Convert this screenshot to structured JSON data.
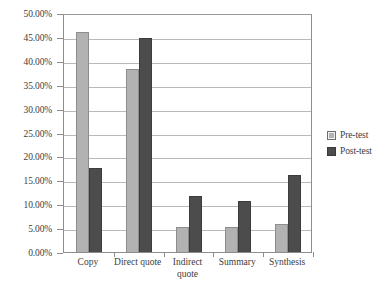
{
  "chart_data": {
    "type": "bar",
    "title": "",
    "xlabel": "",
    "ylabel": "",
    "ylim": [
      0,
      50
    ],
    "ytick_step": 5,
    "grid": true,
    "legend_position": "right",
    "categories": [
      "Copy",
      "Direct quote",
      "Indirect quote",
      "Summary",
      "Synthesis"
    ],
    "ytick_labels": [
      "0.00%",
      "5.00%",
      "10.00%",
      "15.00%",
      "20.00%",
      "25.00%",
      "30.00%",
      "35.00%",
      "40.00%",
      "45.00%",
      "50.00%"
    ],
    "series": [
      {
        "name": "Pre-test",
        "color": "#b2b2b2",
        "values": [
          46.0,
          38.3,
          5.2,
          5.3,
          5.8
        ]
      },
      {
        "name": "Post-test",
        "color": "#4c4c4c",
        "values": [
          17.5,
          44.7,
          11.8,
          10.6,
          16.2
        ]
      }
    ]
  },
  "legend": {
    "items": [
      {
        "label": "Pre-test"
      },
      {
        "label": "Post-test"
      }
    ]
  },
  "axes": {
    "y": {
      "ticks": [
        {
          "label": "50.00%",
          "value": 50
        },
        {
          "label": "45.00%",
          "value": 45
        },
        {
          "label": "40.00%",
          "value": 40
        },
        {
          "label": "35.00%",
          "value": 35
        },
        {
          "label": "30.00%",
          "value": 30
        },
        {
          "label": "25.00%",
          "value": 25
        },
        {
          "label": "20.00%",
          "value": 20
        },
        {
          "label": "15.00%",
          "value": 15
        },
        {
          "label": "10.00%",
          "value": 10
        },
        {
          "label": "5.00%",
          "value": 5
        },
        {
          "label": "0.00%",
          "value": 0
        }
      ]
    },
    "x": {
      "ticks": [
        {
          "label": "Copy"
        },
        {
          "label": "Direct quote"
        },
        {
          "label": "Indirect quote"
        },
        {
          "label": "Summary"
        },
        {
          "label": "Synthesis"
        }
      ]
    }
  }
}
